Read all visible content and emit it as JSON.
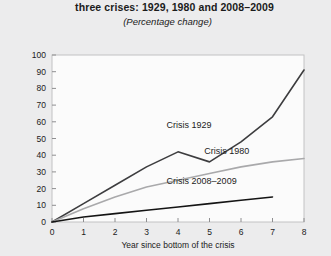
{
  "title": {
    "line1": "three crises: 1929, 1980 and 2008–2009",
    "line2": "(Percentage change)"
  },
  "chart_data": {
    "type": "line",
    "title": "three crises: 1929, 1980 and 2008–2009",
    "subtitle": "(Percentage change)",
    "xlabel": "Year since bottom of the crisis",
    "ylabel": "",
    "xlim": [
      0,
      8
    ],
    "ylim": [
      0,
      100
    ],
    "grid": false,
    "legend_position": "inline-labels",
    "x": [
      0,
      1,
      2,
      3,
      4,
      5,
      6,
      7,
      8
    ],
    "xticks": [
      "0",
      "1",
      "2",
      "3",
      "4",
      "5",
      "6",
      "7",
      "8"
    ],
    "yticks": [
      "0",
      "10",
      "20",
      "30",
      "40",
      "50",
      "60",
      "70",
      "80",
      "90",
      "100"
    ],
    "series": [
      {
        "name": "Crisis 1929",
        "color": "#3d3d3f",
        "x": [
          0,
          1,
          2,
          3,
          4,
          5,
          6,
          7,
          8
        ],
        "values": [
          0,
          11,
          22,
          33,
          42,
          36,
          48,
          63,
          91
        ]
      },
      {
        "name": "Crisis 1980",
        "color": "#a9a9ab",
        "x": [
          0,
          1,
          2,
          3,
          4,
          5,
          6,
          7,
          8
        ],
        "values": [
          0,
          8,
          15,
          21,
          25,
          29,
          33,
          36,
          38
        ]
      },
      {
        "name": "Crisis 2008–2009",
        "color": "#141414",
        "x": [
          0,
          1,
          2,
          3,
          4,
          5,
          6,
          7
        ],
        "values": [
          0,
          3,
          5,
          7,
          9,
          11,
          13,
          15
        ]
      }
    ],
    "annotations": [
      {
        "text": "Crisis 1929",
        "x": 4.35,
        "y": 56
      },
      {
        "text": "Crisis 1980",
        "x": 5.55,
        "y": 41
      },
      {
        "text": "Crisis 2008–2009",
        "x": 4.75,
        "y": 23
      }
    ]
  }
}
